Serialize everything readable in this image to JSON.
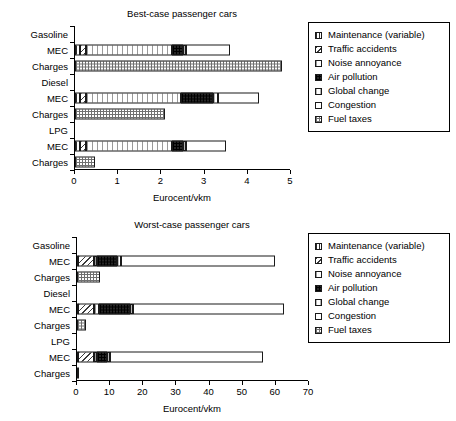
{
  "chart_data": [
    {
      "type": "bar",
      "orientation": "horizontal",
      "title": "Best-case passenger cars",
      "xlabel": "Eurocent/vkm",
      "ylabel": "",
      "xlim": [
        0,
        5
      ],
      "xticks": [
        0,
        1,
        2,
        3,
        4,
        5
      ],
      "xticklabels": [
        "0",
        "1",
        "2",
        "3",
        "4",
        "5"
      ],
      "grid": false,
      "legend_position": "right",
      "categories": [
        "Gasoline",
        "MEC",
        "Charges",
        "Diesel",
        "MEC",
        "Charges",
        "LPG",
        "MEC",
        "Charges"
      ],
      "series": [
        {
          "name": "Maintenance (variable)",
          "values": [
            0,
            0.12,
            0,
            0,
            0.12,
            0,
            0,
            0.12,
            0
          ]
        },
        {
          "name": "Traffic accidents",
          "values": [
            0,
            0.13,
            0,
            0,
            0.13,
            0,
            0,
            0.13,
            0
          ]
        },
        {
          "name": "Noise annoyance",
          "values": [
            0,
            2.0,
            0,
            0,
            2.2,
            0,
            0,
            2.0,
            0
          ]
        },
        {
          "name": "Air pollution",
          "values": [
            0,
            0.25,
            0,
            0,
            0.75,
            0,
            0,
            0.25,
            0
          ]
        },
        {
          "name": "Global change",
          "values": [
            0,
            0.08,
            0,
            0,
            0.1,
            0,
            0,
            0.08,
            0
          ]
        },
        {
          "name": "Congestion",
          "values": [
            0,
            1.0,
            0,
            0,
            0.95,
            0,
            0,
            0.92,
            0
          ]
        },
        {
          "name": "Fuel taxes",
          "values": [
            0,
            0,
            4.8,
            0,
            0,
            2.08,
            0,
            0,
            0.46
          ]
        }
      ],
      "bar_totals": [
        0,
        3.58,
        4.8,
        0,
        4.15,
        2.08,
        0,
        3.5,
        0.46
      ]
    },
    {
      "type": "bar",
      "orientation": "horizontal",
      "title": "Worst-case passenger cars",
      "xlabel": "Eurocent/vkm",
      "ylabel": "",
      "xlim": [
        0,
        70
      ],
      "xticks": [
        0,
        10,
        20,
        30,
        40,
        50,
        60,
        70
      ],
      "xticklabels": [
        "0",
        "10",
        "20",
        "30",
        "40",
        "50",
        "60",
        "70"
      ],
      "grid": false,
      "legend_position": "right",
      "categories": [
        "Gasoline",
        "MEC",
        "Charges",
        "Diesel",
        "MEC",
        "Charges",
        "LPG",
        "MEC",
        "Charges"
      ],
      "series": [
        {
          "name": "Maintenance (variable)",
          "values": [
            0,
            0.4,
            0,
            0,
            0.4,
            0,
            0,
            0.4,
            0
          ]
        },
        {
          "name": "Traffic accidents",
          "values": [
            0,
            4.6,
            0,
            0,
            4.6,
            0,
            0,
            4.6,
            0
          ]
        },
        {
          "name": "Noise annoyance",
          "values": [
            0,
            1.0,
            0,
            0,
            1.6,
            0,
            0,
            1.0,
            0
          ]
        },
        {
          "name": "Air pollution",
          "values": [
            0,
            6.2,
            0,
            0,
            9.4,
            0,
            0,
            3.0,
            0
          ]
        },
        {
          "name": "Global change",
          "values": [
            0,
            1.0,
            0,
            0,
            0.9,
            0,
            0,
            0.9,
            0
          ]
        },
        {
          "name": "Congestion",
          "values": [
            0,
            46.6,
            0,
            0,
            45.6,
            0,
            0,
            46.1,
            0
          ]
        },
        {
          "name": "Fuel taxes",
          "values": [
            0,
            0,
            6.9,
            0,
            0,
            2.8,
            0,
            0,
            0.5
          ]
        }
      ],
      "bar_totals": [
        0,
        59.8,
        6.9,
        0,
        62.5,
        2.8,
        0,
        56.0,
        0.5
      ]
    }
  ],
  "legend": {
    "items": [
      {
        "label": "Maintenance (variable)",
        "pattern": "p-maintenance"
      },
      {
        "label": "Traffic accidents",
        "pattern": "p-traffic"
      },
      {
        "label": "Noise annoyance",
        "pattern": "p-noise"
      },
      {
        "label": "Air pollution",
        "pattern": "p-air"
      },
      {
        "label": "Global change",
        "pattern": "p-global"
      },
      {
        "label": "Congestion",
        "pattern": "p-congestion"
      },
      {
        "label": "Fuel taxes",
        "pattern": "p-fuel"
      }
    ]
  },
  "colors": {
    "axis": "#000000",
    "bar_outline": "#1a1a1a",
    "air_pollution_fill": "#262626",
    "background": "#ffffff"
  }
}
